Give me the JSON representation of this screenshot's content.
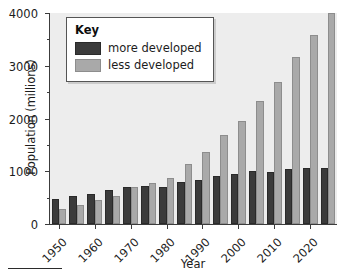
{
  "chart_data": {
    "type": "bar",
    "title": "",
    "xlabel": "Year",
    "ylabel": "Population (millions)",
    "ylim": [
      0,
      4000
    ],
    "yticks": [
      0,
      1000,
      2000,
      3000,
      4000
    ],
    "ytick_labels": [
      "0",
      "1000",
      "2000",
      "3000",
      "4000"
    ],
    "yminor_ticks": [
      500,
      1500,
      2500,
      3500
    ],
    "grid": false,
    "legend_position": "upper-left-inside",
    "legend_title": "Key",
    "categories": [
      "1950",
      "1955",
      "1960",
      "1965",
      "1970",
      "1975",
      "1980",
      "1985",
      "1990",
      "1995",
      "2000",
      "2005",
      "2010",
      "2015",
      "2020",
      "2025"
    ],
    "xtick_labels": [
      "1950",
      "1960",
      "1970",
      "1980",
      "1990",
      "2000",
      "2010",
      "2020"
    ],
    "xtick_categories": [
      "1950",
      "1960",
      "1970",
      "1980",
      "1990",
      "2000",
      "2010",
      "2020"
    ],
    "series": [
      {
        "name": "more developed",
        "color": "#3b3b3b",
        "values": [
          470,
          530,
          570,
          650,
          700,
          720,
          710,
          790,
          840,
          910,
          940,
          1000,
          990,
          1050,
          1055,
          1055
        ]
      },
      {
        "name": "less developed",
        "color": "#a9a9a9",
        "values": [
          290,
          360,
          460,
          530,
          700,
          770,
          880,
          1130,
          1370,
          1690,
          1950,
          2330,
          2700,
          3160,
          3580,
          4000
        ]
      }
    ]
  },
  "legend": {
    "title": "Key",
    "items": [
      {
        "label": "more developed",
        "color": "#3b3b3b"
      },
      {
        "label": "less developed",
        "color": "#a9a9a9"
      }
    ]
  },
  "axes": {
    "ylabel": "Population (millions)",
    "xlabel": "Year"
  },
  "colors": {
    "more_developed": "#3b3b3b",
    "less_developed": "#a9a9a9",
    "plot_background": "#ededed",
    "axis": "#3c3c3c",
    "text": "#1c1c1c"
  }
}
